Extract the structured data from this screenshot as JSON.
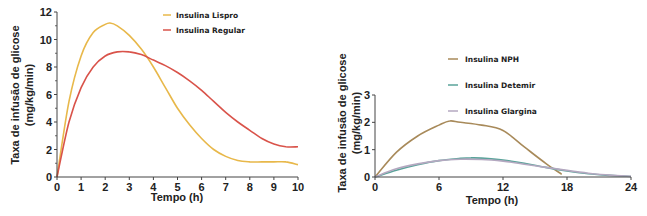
{
  "chart_data": [
    {
      "type": "line",
      "title": "",
      "xlabel": "Tempo (h)",
      "ylabel_line1": "Taxa de infusão de glicose",
      "ylabel_line2": "(mg/kg/min)",
      "xlim": [
        0,
        10
      ],
      "ylim": [
        0,
        12
      ],
      "xticks": [
        "0",
        "1",
        "2",
        "3",
        "4",
        "5",
        "6",
        "7",
        "8",
        "9",
        "10"
      ],
      "yticks": [
        "0",
        "2",
        "4",
        "6",
        "8",
        "10",
        "12"
      ],
      "grid": false,
      "legend_position": "top-right",
      "series": [
        {
          "name": "Insulina Lispro",
          "color": "#e8b84a",
          "x": [
            0,
            0.5,
            1,
            1.5,
            2,
            2.2,
            2.5,
            3,
            3.5,
            4,
            4.5,
            5,
            5.5,
            6,
            6.5,
            7,
            7.5,
            8,
            8.5,
            9,
            9.5,
            10
          ],
          "y": [
            0,
            5.5,
            8.8,
            10.5,
            11.1,
            11.2,
            11.0,
            10.3,
            9.3,
            8.0,
            6.5,
            5.0,
            3.8,
            2.8,
            2.0,
            1.5,
            1.2,
            1.1,
            1.1,
            1.1,
            1.1,
            0.9
          ]
        },
        {
          "name": "Insulina Regular",
          "color": "#d9534a",
          "x": [
            0,
            0.5,
            1,
            1.5,
            2,
            2.5,
            3,
            3.5,
            4,
            4.5,
            5,
            5.5,
            6,
            6.5,
            7,
            7.5,
            8,
            8.5,
            9,
            9.5,
            10
          ],
          "y": [
            0,
            4.0,
            6.5,
            8.0,
            8.8,
            9.1,
            9.1,
            8.9,
            8.5,
            8.1,
            7.6,
            7.0,
            6.3,
            5.5,
            4.7,
            4.0,
            3.4,
            2.8,
            2.4,
            2.2,
            2.2
          ]
        }
      ]
    },
    {
      "type": "line",
      "title": "",
      "xlabel": "Tempo (h)",
      "ylabel_line1": "Taxa de infusão de glicose",
      "ylabel_line2": "(mg/kg/min)",
      "xlim": [
        0,
        24
      ],
      "ylim": [
        0,
        3
      ],
      "xticks": [
        "0",
        "6",
        "12",
        "18",
        "24"
      ],
      "yticks": [
        "0",
        "1",
        "2",
        "3"
      ],
      "grid": false,
      "legend_position": "top-center",
      "series": [
        {
          "name": "Insulina NPH",
          "color": "#a88a5a",
          "x": [
            0,
            2,
            4,
            6,
            7,
            8,
            10,
            12,
            14,
            16,
            17.5
          ],
          "y": [
            0,
            0.9,
            1.5,
            1.9,
            2.05,
            2.0,
            1.9,
            1.7,
            1.1,
            0.5,
            0.1
          ]
        },
        {
          "name": "Insulina Detemir",
          "color": "#5aa39a",
          "x": [
            0,
            2,
            4,
            6,
            8,
            9,
            10,
            12,
            14,
            16,
            18,
            20,
            22,
            24
          ],
          "y": [
            0,
            0.25,
            0.45,
            0.6,
            0.68,
            0.7,
            0.69,
            0.62,
            0.5,
            0.35,
            0.22,
            0.12,
            0.06,
            0.02
          ]
        },
        {
          "name": "Insulina Glargina",
          "color": "#b4a8c0",
          "x": [
            0,
            2,
            4,
            6,
            8,
            10,
            12,
            14,
            16,
            18,
            20,
            22,
            24
          ],
          "y": [
            0,
            0.3,
            0.48,
            0.6,
            0.65,
            0.64,
            0.58,
            0.47,
            0.35,
            0.24,
            0.14,
            0.07,
            0.03
          ]
        }
      ]
    }
  ]
}
